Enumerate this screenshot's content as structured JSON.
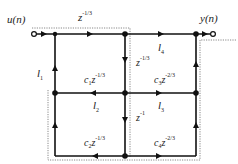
{
  "diagram": {
    "type": "signal-flow-graph",
    "input_label": "u(n)",
    "output_label": "y(n)",
    "colors": {
      "line": "#111111",
      "dotted_box": "#888888",
      "text": "#222222"
    },
    "branches": {
      "top_delay": {
        "base": "z",
        "exp": "-1/3"
      },
      "l1": {
        "base": "l",
        "sub": "1"
      },
      "l2": {
        "base": "l",
        "sub": "2"
      },
      "l3": {
        "base": "l",
        "sub": "3"
      },
      "l4": {
        "base": "l",
        "sub": "4"
      },
      "mid_vertical_upper": {
        "base": "z",
        "exp": "-1/3"
      },
      "mid_vertical_lower": {
        "base": "z",
        "exp": "-1"
      },
      "c1": {
        "coef": "c",
        "sub": "1",
        "base": "z",
        "exp": "-1/3"
      },
      "c2": {
        "coef": "c",
        "sub": "2",
        "base": "z",
        "exp": "-1/3"
      },
      "c3": {
        "coef": "c",
        "sub": "3",
        "base": "z",
        "exp": "-2/3"
      },
      "c4": {
        "coef": "c",
        "sub": "4",
        "base": "z",
        "exp": "-2/3"
      }
    }
  }
}
